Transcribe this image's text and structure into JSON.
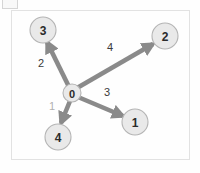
{
  "canvas": {
    "width": 200,
    "height": 173,
    "background": "#fefefe"
  },
  "frame": {
    "border_color": "#e2e2e2",
    "background": "#fefefe"
  },
  "chart_data": {
    "type": "diagram",
    "title": "",
    "node_fill": "#e9e9e9",
    "node_stroke": "#b4b4b4",
    "node_text_color": "#2b2b2b",
    "edge_color": "#8a8a8a",
    "nodes": [
      {
        "id": "0",
        "label": "0",
        "cx": 72,
        "cy": 93,
        "r": 9,
        "font_size": 11
      },
      {
        "id": "1",
        "label": "1",
        "cx": 135,
        "cy": 122,
        "r": 13,
        "font_size": 12
      },
      {
        "id": "2",
        "label": "2",
        "cx": 165,
        "cy": 36,
        "r": 13,
        "font_size": 12
      },
      {
        "id": "3",
        "label": "3",
        "cx": 43,
        "cy": 30,
        "r": 13,
        "font_size": 12
      },
      {
        "id": "4",
        "label": "4",
        "cx": 58,
        "cy": 137,
        "r": 13,
        "font_size": 12
      }
    ],
    "edges": [
      {
        "id": "edge-0-3",
        "source": "0",
        "target": "3",
        "weight": "2",
        "label_x": 41,
        "label_y": 63,
        "label_color": "#3a3a3a",
        "label_font_size": 11,
        "x1": 72,
        "y1": 93,
        "x2": 47,
        "y2": 42
      },
      {
        "id": "edge-0-2",
        "source": "0",
        "target": "2",
        "weight": "4",
        "label_x": 110,
        "label_y": 47,
        "label_color": "#3a3a3a",
        "label_font_size": 11,
        "x1": 77,
        "y1": 88,
        "x2": 153,
        "y2": 44
      },
      {
        "id": "edge-0-1",
        "source": "0",
        "target": "1",
        "weight": "3",
        "label_x": 107,
        "label_y": 92,
        "label_color": "#3a3a3a",
        "label_font_size": 11,
        "x1": 78,
        "y1": 97,
        "x2": 123,
        "y2": 116
      },
      {
        "id": "edge-0-4",
        "source": "0",
        "target": "4",
        "weight": "1",
        "label_x": 52,
        "label_y": 106,
        "label_color": "#b0b0b0",
        "label_font_size": 11,
        "x1": 70,
        "y1": 101,
        "x2": 61,
        "y2": 123
      }
    ]
  }
}
